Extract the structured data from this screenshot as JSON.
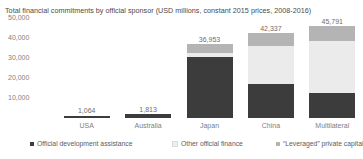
{
  "chart_data": {
    "type": "bar",
    "title": "Total financial commitments by official sponsor (USD millions, constant 2015 prices, 2008-2016)",
    "xlabel": "",
    "ylabel": "",
    "categories": [
      "USA",
      "Australia",
      "Japan",
      "China",
      "Multilateral"
    ],
    "totals": [
      "1,064",
      "1,813",
      "36,953",
      "42,337",
      "45,791"
    ],
    "totals_numeric": [
      1064,
      1813,
      36953,
      42337,
      45791
    ],
    "ylim": [
      0,
      50000
    ],
    "yticks": [
      "10,000",
      "20,000",
      "30,000",
      "40,000",
      "50,000"
    ],
    "yticks_numeric": [
      10000,
      20000,
      30000,
      40000,
      50000
    ],
    "grid": false,
    "legend_position": "bottom",
    "stacked": true,
    "series": [
      {
        "name": "Official development assistance",
        "color": "#3c3c3c",
        "values": [
          1064,
          1813,
          30500,
          17200,
          12400
        ]
      },
      {
        "name": "Other official finance",
        "color": "#ebebeb",
        "values": [
          0,
          0,
          2100,
          18900,
          25900
        ]
      },
      {
        "name": "“Leveraged” private capital",
        "color": "#b4b4b4",
        "values": [
          0,
          0,
          4353,
          6237,
          7491
        ]
      }
    ]
  }
}
